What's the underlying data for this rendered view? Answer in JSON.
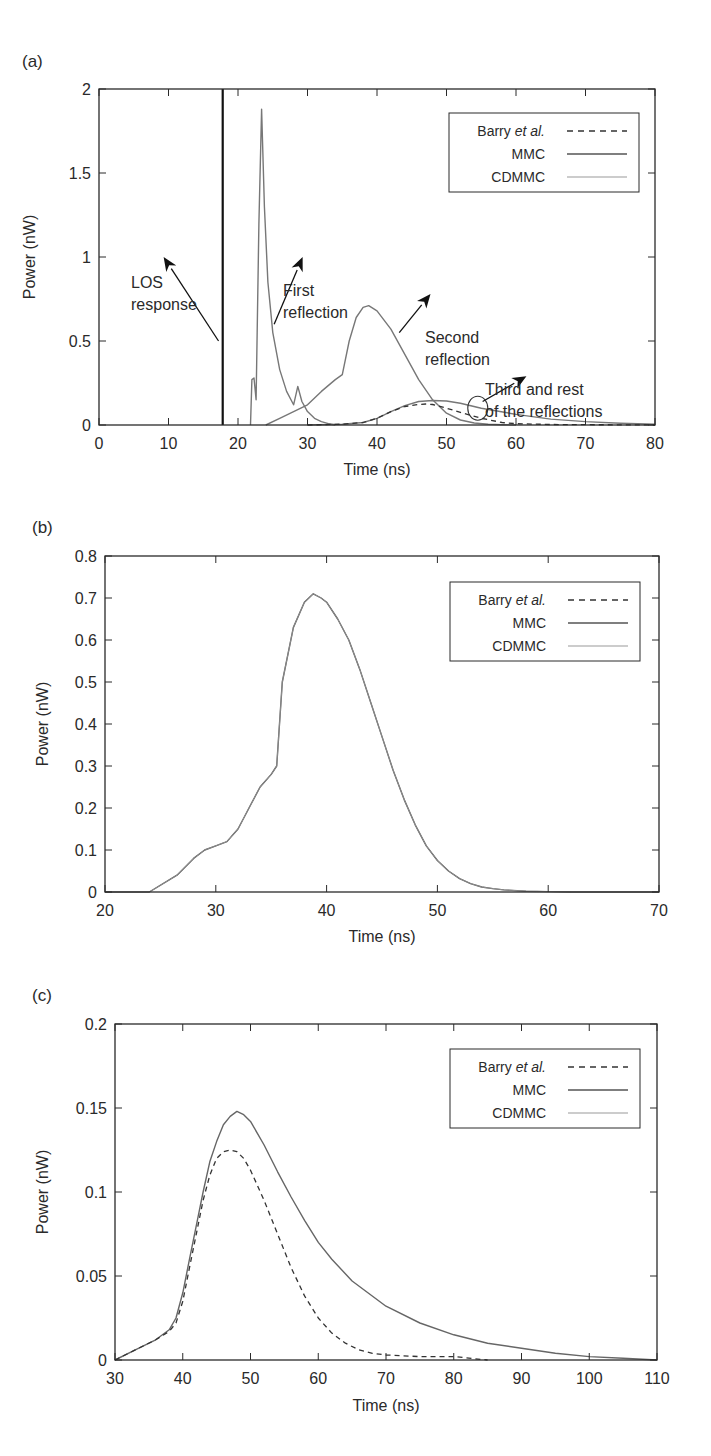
{
  "chart_data": [
    {
      "panel": "(a)",
      "type": "line",
      "xlabel": "Time (ns)",
      "ylabel": "Power (nW)",
      "xlim": [
        0,
        80
      ],
      "ylim": [
        0,
        2
      ],
      "xticks": [
        0,
        10,
        20,
        30,
        40,
        50,
        60,
        70,
        80
      ],
      "yticks": [
        0,
        0.5,
        1,
        1.5,
        2
      ],
      "ytick_labels": [
        "0",
        "0.5",
        "1",
        "1.5",
        "2"
      ],
      "grid": false,
      "legend": {
        "position": "upper right",
        "entries": [
          {
            "label": "Barry",
            "label_italic": "et al.",
            "style": "dashed",
            "color": "#333333"
          },
          {
            "label": "MMC",
            "style": "solid",
            "color": "#555555"
          },
          {
            "label": "CDMMC",
            "style": "solid",
            "color": "#9a9a9a"
          }
        ]
      },
      "vline": {
        "x": 17.8,
        "label": "LOS impulse"
      },
      "series": [
        {
          "name": "First reflection (MMC/CDMMC)",
          "style": "solid",
          "color": "#777777",
          "x": [
            21.8,
            22.0,
            22.3,
            22.6,
            23.0,
            23.4,
            23.8,
            24.3,
            25.0,
            26.0,
            27.0,
            28.0,
            28.6,
            29.2,
            30.0,
            31.0,
            32.0,
            33.0,
            34.0
          ],
          "y": [
            0,
            0.27,
            0.28,
            0.15,
            1.2,
            1.88,
            1.3,
            0.85,
            0.55,
            0.33,
            0.2,
            0.12,
            0.23,
            0.14,
            0.08,
            0.04,
            0.02,
            0.008,
            0
          ]
        },
        {
          "name": "Second reflection (MMC/CDMMC)",
          "style": "solid",
          "color": "#777777",
          "x": [
            24,
            26,
            28,
            30,
            32,
            34,
            35,
            36,
            37,
            38,
            38.8,
            40,
            42,
            44,
            46,
            48,
            50,
            52,
            54,
            56,
            58,
            60
          ],
          "y": [
            0,
            0.04,
            0.08,
            0.12,
            0.2,
            0.27,
            0.3,
            0.5,
            0.64,
            0.7,
            0.71,
            0.68,
            0.57,
            0.42,
            0.27,
            0.15,
            0.07,
            0.03,
            0.012,
            0.005,
            0.002,
            0
          ]
        },
        {
          "name": "Third and rest (MMC/CDMMC)",
          "style": "solid",
          "color": "#777777",
          "x": [
            30,
            35,
            38,
            40,
            42,
            44,
            46,
            48,
            50,
            52,
            55,
            60,
            65,
            70,
            75,
            80
          ],
          "y": [
            0,
            0.005,
            0.015,
            0.04,
            0.08,
            0.115,
            0.14,
            0.146,
            0.143,
            0.13,
            0.1,
            0.063,
            0.035,
            0.02,
            0.01,
            0.004
          ]
        },
        {
          "name": "Third and rest (Barry et al.)",
          "style": "dashed",
          "color": "#333333",
          "x": [
            30,
            35,
            38,
            40,
            42,
            44,
            46,
            47,
            48,
            50,
            52,
            55,
            58,
            60,
            65,
            70,
            75,
            80
          ],
          "y": [
            0,
            0.005,
            0.015,
            0.04,
            0.08,
            0.11,
            0.122,
            0.125,
            0.122,
            0.1,
            0.075,
            0.04,
            0.015,
            0.008,
            0.003,
            0.002,
            0.001,
            0
          ]
        }
      ],
      "annotations": [
        {
          "text_lines": [
            "LOS",
            "response"
          ],
          "text_xy": [
            12,
            1.3
          ],
          "arrow_from": [
            17.2,
            0.5
          ],
          "arrow_to": [
            9.3,
            1.0
          ]
        },
        {
          "text_lines": [
            "First",
            "reflection"
          ],
          "text_xy": [
            25.2,
            1.2
          ],
          "arrow_from": [
            25.2,
            0.6
          ],
          "arrow_to": [
            29.3,
            1.0
          ]
        },
        {
          "text_lines": [
            "Second",
            "reflection"
          ],
          "text_xy": [
            45,
            1.0
          ],
          "arrow_from": [
            43.2,
            0.55
          ],
          "arrow_to": [
            47.7,
            0.78
          ]
        },
        {
          "text_lines": [
            "Third and rest",
            "of the reflections"
          ],
          "text_xy": [
            53,
            0.56
          ],
          "arrow_from": [
            55.2,
            0.14
          ],
          "arrow_to": [
            61.5,
            0.29
          ],
          "circle_at": [
            54.5,
            0.1
          ]
        }
      ]
    },
    {
      "panel": "(b)",
      "type": "line",
      "xlabel": "Time (ns)",
      "ylabel": "Power (nW)",
      "xlim": [
        20,
        70
      ],
      "ylim": [
        0,
        0.8
      ],
      "xticks": [
        20,
        30,
        40,
        50,
        60,
        70
      ],
      "yticks": [
        0,
        0.1,
        0.2,
        0.3,
        0.4,
        0.5,
        0.6,
        0.7,
        0.8
      ],
      "ytick_labels": [
        "0",
        "0.1",
        "0.2",
        "0.3",
        "0.4",
        "0.5",
        "0.6",
        "0.7",
        "0.8"
      ],
      "grid": false,
      "legend": {
        "position": "upper right",
        "entries": [
          {
            "label": "Barry",
            "label_italic": "et al.",
            "style": "dashed",
            "color": "#333333"
          },
          {
            "label": "MMC",
            "style": "solid",
            "color": "#555555"
          },
          {
            "label": "CDMMC",
            "style": "solid",
            "color": "#9a9a9a"
          }
        ]
      },
      "series": [
        {
          "name": "MMC / CDMMC / Barry et al. (overlapping)",
          "style": "solid",
          "color": "#555555",
          "x": [
            20,
            24,
            26.5,
            28,
            29,
            30,
            31,
            32,
            33,
            34,
            35,
            35.5,
            36,
            37,
            38,
            38.8,
            39.5,
            40,
            41,
            42,
            43,
            44,
            45,
            46,
            47,
            48,
            49,
            50,
            51,
            52,
            53,
            54,
            55,
            56,
            58,
            60,
            62,
            70
          ],
          "y": [
            0,
            0,
            0.04,
            0.08,
            0.1,
            0.11,
            0.12,
            0.15,
            0.2,
            0.25,
            0.28,
            0.3,
            0.5,
            0.63,
            0.69,
            0.71,
            0.7,
            0.69,
            0.65,
            0.6,
            0.53,
            0.45,
            0.37,
            0.29,
            0.22,
            0.16,
            0.11,
            0.075,
            0.05,
            0.032,
            0.02,
            0.012,
            0.008,
            0.005,
            0.002,
            0.001,
            0,
            0
          ]
        }
      ]
    },
    {
      "panel": "(c)",
      "type": "line",
      "xlabel": "Time (ns)",
      "ylabel": "Power (nW)",
      "xlim": [
        30,
        110
      ],
      "ylim": [
        0,
        0.2
      ],
      "xticks": [
        30,
        40,
        50,
        60,
        70,
        80,
        90,
        100,
        110
      ],
      "yticks": [
        0,
        0.05,
        0.1,
        0.15,
        0.2
      ],
      "ytick_labels": [
        "0",
        "0.05",
        "0.1",
        "0.15",
        "0.2"
      ],
      "grid": false,
      "legend": {
        "position": "upper right",
        "entries": [
          {
            "label": "Barry",
            "label_italic": "et al.",
            "style": "dashed",
            "color": "#333333"
          },
          {
            "label": "MMC",
            "style": "solid",
            "color": "#555555"
          },
          {
            "label": "CDMMC",
            "style": "solid",
            "color": "#9a9a9a"
          }
        ]
      },
      "series": [
        {
          "name": "MMC / CDMMC",
          "style": "solid",
          "color": "#666666",
          "x": [
            30,
            33,
            36,
            38,
            39,
            40,
            41,
            42,
            43,
            44,
            45,
            46,
            47,
            48,
            49,
            50,
            52,
            54,
            56,
            58,
            60,
            62,
            65,
            70,
            75,
            80,
            85,
            90,
            95,
            100,
            105,
            110
          ],
          "y": [
            0,
            0.006,
            0.012,
            0.018,
            0.025,
            0.04,
            0.06,
            0.08,
            0.1,
            0.118,
            0.13,
            0.14,
            0.145,
            0.148,
            0.146,
            0.142,
            0.128,
            0.112,
            0.097,
            0.083,
            0.07,
            0.06,
            0.047,
            0.032,
            0.022,
            0.015,
            0.01,
            0.007,
            0.004,
            0.002,
            0.001,
            0
          ]
        },
        {
          "name": "Barry et al.",
          "style": "dashed",
          "color": "#333333",
          "x": [
            30,
            33,
            36,
            38,
            39,
            40,
            41,
            42,
            43,
            44,
            45,
            46,
            47,
            48,
            49,
            50,
            52,
            54,
            56,
            58,
            60,
            62,
            64,
            66,
            68,
            70,
            75,
            80,
            85
          ],
          "y": [
            0,
            0.006,
            0.012,
            0.017,
            0.022,
            0.035,
            0.055,
            0.075,
            0.095,
            0.11,
            0.12,
            0.124,
            0.125,
            0.124,
            0.12,
            0.113,
            0.095,
            0.075,
            0.055,
            0.038,
            0.025,
            0.016,
            0.01,
            0.006,
            0.004,
            0.003,
            0.002,
            0.002,
            0
          ]
        }
      ]
    }
  ],
  "panels": {
    "a": {
      "label": "(a)",
      "xlabel": "Time (ns)",
      "ylabel": "Power (nW)",
      "xtick_labels": [
        "0",
        "10",
        "20",
        "30",
        "40",
        "50",
        "60",
        "70",
        "80"
      ],
      "ytick_labels": [
        "0",
        "0.5",
        "1",
        "1.5",
        "2"
      ],
      "legend": {
        "barry": "Barry",
        "barry_italic": "et al.",
        "mmc": "MMC",
        "cdmmc": "CDMMC"
      },
      "annotations": {
        "los_1": "LOS",
        "los_2": "response",
        "first_1": "First",
        "first_2": "reflection",
        "second_1": "Second",
        "second_2": "reflection",
        "third_1": "Third and rest",
        "third_2": "of the reflections"
      }
    },
    "b": {
      "label": "(b)",
      "xlabel": "Time (ns)",
      "ylabel": "Power (nW)",
      "xtick_labels": [
        "20",
        "30",
        "40",
        "50",
        "60",
        "70"
      ],
      "ytick_labels": [
        "0",
        "0.1",
        "0.2",
        "0.3",
        "0.4",
        "0.5",
        "0.6",
        "0.7",
        "0.8"
      ],
      "legend": {
        "barry": "Barry",
        "barry_italic": "et al.",
        "mmc": "MMC",
        "cdmmc": "CDMMC"
      }
    },
    "c": {
      "label": "(c)",
      "xlabel": "Time (ns)",
      "ylabel": "Power (nW)",
      "xtick_labels": [
        "30",
        "40",
        "50",
        "60",
        "70",
        "80",
        "90",
        "100",
        "110"
      ],
      "ytick_labels": [
        "0",
        "0.05",
        "0.1",
        "0.15",
        "0.2"
      ],
      "legend": {
        "barry": "Barry",
        "barry_italic": "et al.",
        "mmc": "MMC",
        "cdmmc": "CDMMC"
      }
    }
  },
  "colors": {
    "axis": "#2a2a2a",
    "mmc": "#555555",
    "cdmmc": "#9a9a9a",
    "barry": "#333333",
    "curve": "#777777"
  }
}
